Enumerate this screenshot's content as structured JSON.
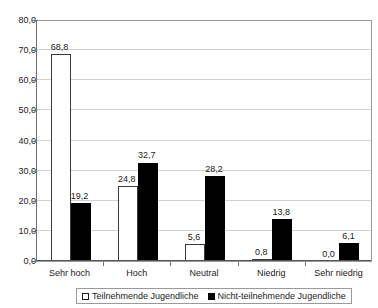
{
  "chart_data": {
    "type": "bar",
    "title": "",
    "subtitle": "",
    "xlabel": "",
    "ylabel": "",
    "categories": [
      "Sehr hoch",
      "Hoch",
      "Neutral",
      "Niedrig",
      "Sehr niedrig"
    ],
    "series": [
      {
        "name": "Teilnehmende Jugendliche",
        "values": [
          68.8,
          24.8,
          5.6,
          0.8,
          0.0
        ],
        "labels": [
          "68,8",
          "24,8",
          "5,6",
          "0,8",
          "0,0"
        ],
        "color": "#ffffff",
        "border_color": "#3a3a3a",
        "swatch": "hollow-square"
      },
      {
        "name": "Nicht-teilnehmende Jugendliche",
        "values": [
          19.2,
          32.7,
          28.2,
          13.8,
          6.1
        ],
        "labels": [
          "19,2",
          "32,7",
          "28,2",
          "13,8",
          "6,1"
        ],
        "color": "#000000",
        "border_color": "#000000",
        "swatch": "filled-square"
      }
    ],
    "ylim": [
      0,
      80
    ],
    "ytick_step": 10,
    "ytick_labels": [
      "0,0",
      "10,0",
      "20,0",
      "30,0",
      "40,0",
      "50,0",
      "60,0",
      "70,0",
      "80,0"
    ],
    "ytick_values": [
      0,
      10,
      20,
      30,
      40,
      50,
      60,
      70,
      80
    ],
    "grid": true,
    "grid_axis": "y",
    "legend_position": "bottom",
    "decimal_separator": ","
  },
  "legend": {
    "entries": [
      {
        "label": "Teilnehmende Jugendliche"
      },
      {
        "label": "Nicht-teilnehmende Jugendliche"
      }
    ]
  }
}
